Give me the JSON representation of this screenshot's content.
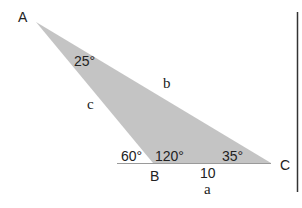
{
  "diagram": {
    "fill_color": "#c4c4c4",
    "line_color": "#333333",
    "vertices": [
      {
        "label": "A",
        "x": 36,
        "y": 22
      },
      {
        "label": "B",
        "x": 153,
        "y": 163
      },
      {
        "label": "C",
        "x": 271,
        "y": 163
      }
    ],
    "vertex_labels": {
      "A": "A",
      "B": "B",
      "C": "C"
    },
    "angles": {
      "A": "25°",
      "B_interior": "120°",
      "B_exterior": "60°",
      "C": "35°"
    },
    "sides": {
      "a": "a",
      "b": "b",
      "c": "c",
      "a_length": "10"
    }
  }
}
